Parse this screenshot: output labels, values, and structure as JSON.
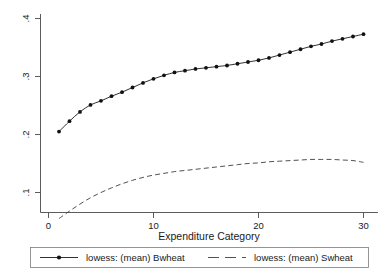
{
  "chart_data": {
    "type": "line",
    "title": "",
    "subtitle": "",
    "xlabel": "Expenditure Category",
    "ylabel": "",
    "xlim": [
      0,
      31
    ],
    "ylim": [
      0.04,
      0.41
    ],
    "xticks": [
      0,
      10,
      20,
      30
    ],
    "xticklabels": [
      "0",
      "10",
      "20",
      "30"
    ],
    "yticks": [
      0.1,
      0.2,
      0.3,
      0.4
    ],
    "yticklabels": [
      ".1",
      ".2",
      ".3",
      ".4"
    ],
    "grid": false,
    "legend_position": "below",
    "ytick_rotation": 90,
    "x": [
      1,
      2,
      3,
      4,
      5,
      6,
      7,
      8,
      9,
      10,
      11,
      12,
      13,
      14,
      15,
      16,
      17,
      18,
      19,
      20,
      21,
      22,
      23,
      24,
      25,
      26,
      27,
      28,
      29,
      30
    ],
    "series": [
      {
        "name": "lowess: (mean) Bwheat",
        "style": "solid",
        "marker": "circle",
        "values": [
          0.205,
          0.223,
          0.239,
          0.251,
          0.258,
          0.266,
          0.273,
          0.281,
          0.289,
          0.296,
          0.302,
          0.307,
          0.31,
          0.313,
          0.315,
          0.317,
          0.319,
          0.322,
          0.325,
          0.328,
          0.332,
          0.337,
          0.342,
          0.347,
          0.352,
          0.356,
          0.361,
          0.365,
          0.369,
          0.373
        ]
      },
      {
        "name": "lowess: (mean) Swheat",
        "style": "dashed",
        "marker": "none",
        "values": [
          0.055,
          0.068,
          0.08,
          0.091,
          0.1,
          0.108,
          0.115,
          0.121,
          0.126,
          0.13,
          0.133,
          0.136,
          0.138,
          0.14,
          0.142,
          0.144,
          0.146,
          0.148,
          0.15,
          0.151,
          0.153,
          0.154,
          0.155,
          0.156,
          0.157,
          0.157,
          0.157,
          0.156,
          0.155,
          0.152
        ]
      }
    ]
  },
  "legend": {
    "entries": [
      {
        "label": "lowess: (mean) Bwheat",
        "style": "solid-marker"
      },
      {
        "label": "lowess: (mean) Swheat",
        "style": "dashed"
      }
    ]
  },
  "axis": {
    "x_title": "Expenditure Category"
  }
}
